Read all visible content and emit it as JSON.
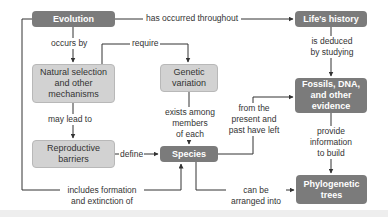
{
  "nodes": {
    "evolution": "Evolution",
    "lifes_history": "Life's history",
    "natural_selection": "Natural selection and other mechanisms",
    "genetic_variation": "Genetic variation",
    "reproductive_barriers": "Reproductive barriers",
    "species": "Species",
    "fossils": "Fossils, DNA, and other evidence",
    "phylogenetic_trees": "Phylogenetic trees"
  },
  "edges": {
    "has_occurred": "has occurred throughout",
    "occurs_by": "occurs by",
    "require": "require",
    "may_lead_to": "may lead to",
    "exists_among_1": "exists among",
    "exists_among_2": "members",
    "exists_among_3": "of each",
    "define": "define",
    "is_deduced_1": "is deduced",
    "is_deduced_2": "by studying",
    "from_the_1": "from the",
    "from_the_2": "present and",
    "from_the_3": "past have left",
    "provide_1": "provide",
    "provide_2": "information",
    "provide_3": "to build",
    "includes_1": "includes formation",
    "includes_2": "and extinction of",
    "can_be_1": "can be",
    "can_be_2": "arranged into"
  },
  "colors": {
    "dark_node": "#7b7b7b",
    "light_node": "#d2d2d2",
    "line": "#333333"
  }
}
